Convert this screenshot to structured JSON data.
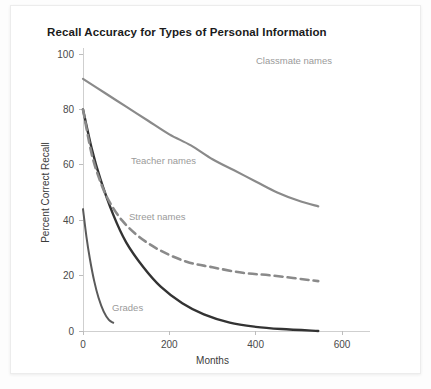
{
  "card": {
    "title": "Recall Accuracy for Types of Personal Information"
  },
  "chart_data": {
    "type": "line",
    "title": "Recall Accuracy for Types of Personal Information",
    "xlabel": "Months",
    "ylabel": "Percent Correct Recall",
    "xlim": [
      0,
      600
    ],
    "ylim": [
      0,
      100
    ],
    "xticks": [
      0,
      200,
      400,
      600
    ],
    "yticks": [
      0,
      20,
      40,
      60,
      80,
      100
    ],
    "xtick_labels": [
      "0",
      "200",
      "400",
      "600"
    ],
    "ytick_labels": [
      "0",
      "20",
      "40",
      "60",
      "80",
      "100"
    ],
    "grid": false,
    "legend": "inline-annotations",
    "series": [
      {
        "name": "Classmate names",
        "style": "solid",
        "color": "#8a8a8a",
        "width": 2.2,
        "label_x": 245,
        "label_y": 58,
        "x": [
          0,
          50,
          100,
          150,
          200,
          250,
          300,
          350,
          400,
          450,
          500,
          545
        ],
        "y": [
          91,
          86,
          81,
          76,
          71,
          67,
          62,
          58,
          54,
          50,
          47,
          45
        ]
      },
      {
        "name": "Street names",
        "style": "solid",
        "color": "#333333",
        "width": 2.4,
        "label_x": 118,
        "label_y": 214,
        "x": [
          0,
          20,
          40,
          70,
          100,
          140,
          180,
          230,
          280,
          340,
          400,
          460,
          545
        ],
        "y": [
          80,
          66,
          55,
          42,
          32,
          23,
          16,
          10,
          6,
          3,
          1.5,
          0.7,
          0
        ]
      },
      {
        "name": "Teacher names",
        "style": "dashed",
        "color": "#8a8a8a",
        "width": 2.6,
        "label_x": 120,
        "label_y": 158,
        "x": [
          0,
          20,
          40,
          60,
          90,
          130,
          180,
          240,
          300,
          370,
          440,
          545
        ],
        "y": [
          80,
          64,
          54,
          47,
          40,
          34,
          29,
          25,
          23,
          21,
          20,
          18
        ]
      },
      {
        "name": "Grades",
        "style": "solid",
        "color": "#5a5a5a",
        "width": 2.0,
        "label_x": 101,
        "label_y": 305,
        "x": [
          0,
          8,
          16,
          26,
          36,
          48,
          60,
          70
        ],
        "y": [
          44,
          34,
          26,
          18,
          12,
          7,
          4,
          3
        ]
      }
    ]
  }
}
